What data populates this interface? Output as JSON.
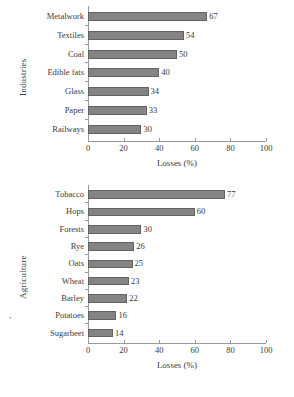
{
  "chart_data": [
    {
      "id": "industries",
      "type": "bar",
      "orientation": "horizontal",
      "title": "",
      "ylabel": "Industries",
      "xlabel": "Losses (%)",
      "xlim": [
        0,
        100
      ],
      "xticks": [
        0,
        20,
        40,
        60,
        80,
        100
      ],
      "grid": false,
      "legend": "none",
      "categories": [
        "Metalwork",
        "Textiles",
        "Coal",
        "Edible fats",
        "Glass",
        "Paper",
        "Railways"
      ],
      "values": [
        67,
        54,
        50,
        40,
        34,
        33,
        30
      ],
      "value_labels": [
        "67",
        "54",
        "50",
        "40",
        "34",
        "33",
        "30"
      ],
      "bar_color": "#848484",
      "bar_edge_color": "#636363"
    },
    {
      "id": "agriculture",
      "type": "bar",
      "orientation": "horizontal",
      "title": "",
      "ylabel": "Agriculture",
      "xlabel": "Losses (%)",
      "xlim": [
        0,
        100
      ],
      "xticks": [
        0,
        20,
        40,
        60,
        80,
        100
      ],
      "grid": false,
      "legend": "none",
      "categories": [
        "Tobacco",
        "Hops",
        "Forests",
        "Rye",
        "Oats",
        "Wheat",
        "Barley",
        "Potatoes",
        "Sugarbeet"
      ],
      "values": [
        77,
        60,
        30,
        26,
        25,
        23,
        22,
        16,
        14
      ],
      "value_labels": [
        "77",
        "60",
        "30",
        "26",
        "25",
        "23",
        "22",
        "16",
        "14"
      ],
      "bar_color": "#848484",
      "bar_edge_color": "#636363"
    }
  ],
  "artifacts": {
    "stray_mark": "•"
  }
}
